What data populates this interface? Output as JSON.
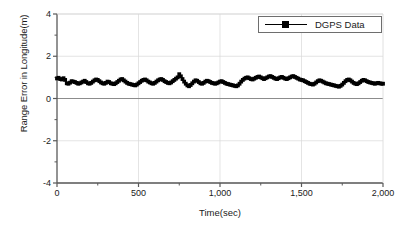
{
  "chart_data": {
    "type": "scatter",
    "title": "",
    "xlabel": "Time(sec)",
    "ylabel": "Range Error in Longitude(m)",
    "xlim": [
      0,
      2000
    ],
    "ylim": [
      -4,
      4
    ],
    "xticks": [
      0,
      500,
      1000,
      1500,
      2000
    ],
    "xtick_labels": [
      "0",
      "500",
      "1,000",
      "1,500",
      "2,000"
    ],
    "yticks": [
      4,
      2,
      0,
      -2,
      -4
    ],
    "ytick_labels": [
      "4",
      "2",
      "0",
      "-2",
      "-4"
    ],
    "grid": true,
    "grid_color": "#d8d8d8",
    "zero_line": true,
    "zero_line_color": "#8c8c8c",
    "legend": {
      "position": "top-right",
      "boxed": true,
      "entries": [
        {
          "name": "DGPS Data",
          "marker": "square",
          "marker_color": "#000000",
          "line_color": "#000000"
        }
      ]
    },
    "series": [
      {
        "name": "DGPS Data",
        "marker": "square",
        "color": "#000000",
        "x": [
          0,
          10,
          20,
          30,
          40,
          50,
          60,
          70,
          80,
          90,
          100,
          110,
          120,
          130,
          140,
          150,
          160,
          170,
          180,
          190,
          200,
          210,
          220,
          230,
          240,
          250,
          260,
          270,
          280,
          290,
          300,
          310,
          320,
          330,
          340,
          350,
          360,
          370,
          380,
          390,
          400,
          410,
          420,
          430,
          440,
          450,
          460,
          470,
          480,
          490,
          500,
          510,
          520,
          530,
          540,
          550,
          560,
          570,
          580,
          590,
          600,
          610,
          620,
          630,
          640,
          650,
          660,
          670,
          680,
          690,
          700,
          710,
          720,
          730,
          740,
          750,
          760,
          770,
          780,
          790,
          800,
          810,
          820,
          830,
          840,
          850,
          860,
          870,
          880,
          890,
          900,
          910,
          920,
          930,
          940,
          950,
          960,
          970,
          980,
          990,
          1000,
          1010,
          1020,
          1030,
          1040,
          1050,
          1060,
          1070,
          1080,
          1090,
          1100,
          1110,
          1120,
          1130,
          1140,
          1150,
          1160,
          1170,
          1180,
          1190,
          1200,
          1210,
          1220,
          1230,
          1240,
          1250,
          1260,
          1270,
          1280,
          1290,
          1300,
          1310,
          1320,
          1330,
          1340,
          1350,
          1360,
          1370,
          1380,
          1390,
          1400,
          1410,
          1420,
          1430,
          1440,
          1450,
          1460,
          1470,
          1480,
          1490,
          1500,
          1510,
          1520,
          1530,
          1540,
          1550,
          1560,
          1570,
          1580,
          1590,
          1600,
          1610,
          1620,
          1630,
          1640,
          1650,
          1660,
          1670,
          1680,
          1690,
          1700,
          1710,
          1720,
          1730,
          1740,
          1750,
          1760,
          1770,
          1780,
          1790,
          1800,
          1810,
          1820,
          1830,
          1840,
          1850,
          1860,
          1870,
          1880,
          1890,
          1900,
          1910,
          1920,
          1930,
          1940,
          1950,
          1960,
          1970,
          1980,
          1990,
          2000
        ],
        "y": [
          0.95,
          0.98,
          0.92,
          0.9,
          0.96,
          0.88,
          0.72,
          0.7,
          0.75,
          0.82,
          0.8,
          0.78,
          0.74,
          0.7,
          0.72,
          0.76,
          0.8,
          0.84,
          0.78,
          0.72,
          0.7,
          0.74,
          0.8,
          0.86,
          0.9,
          0.88,
          0.82,
          0.76,
          0.72,
          0.7,
          0.74,
          0.8,
          0.78,
          0.72,
          0.7,
          0.68,
          0.72,
          0.78,
          0.84,
          0.9,
          0.92,
          0.86,
          0.8,
          0.74,
          0.7,
          0.68,
          0.66,
          0.64,
          0.62,
          0.66,
          0.72,
          0.78,
          0.84,
          0.88,
          0.9,
          0.86,
          0.8,
          0.76,
          0.72,
          0.7,
          0.74,
          0.8,
          0.86,
          0.9,
          0.92,
          0.88,
          0.82,
          0.78,
          0.74,
          0.72,
          0.76,
          0.82,
          0.88,
          0.94,
          1.0,
          1.15,
          1.05,
          0.92,
          0.8,
          0.7,
          0.62,
          0.58,
          0.64,
          0.72,
          0.8,
          0.86,
          0.84,
          0.78,
          0.72,
          0.7,
          0.74,
          0.8,
          0.84,
          0.82,
          0.78,
          0.74,
          0.72,
          0.7,
          0.72,
          0.76,
          0.8,
          0.82,
          0.78,
          0.74,
          0.7,
          0.68,
          0.66,
          0.64,
          0.62,
          0.6,
          0.58,
          0.62,
          0.7,
          0.8,
          0.88,
          0.94,
          0.98,
          1.0,
          0.96,
          0.92,
          0.9,
          0.94,
          0.98,
          1.02,
          1.04,
          1.0,
          0.96,
          0.92,
          0.96,
          1.0,
          1.04,
          1.06,
          1.02,
          0.98,
          0.94,
          0.92,
          0.96,
          1.0,
          1.02,
          0.98,
          0.94,
          0.92,
          0.96,
          1.0,
          1.04,
          1.06,
          1.02,
          0.98,
          0.94,
          0.9,
          0.88,
          0.86,
          0.82,
          0.78,
          0.74,
          0.7,
          0.68,
          0.66,
          0.7,
          0.76,
          0.82,
          0.86,
          0.84,
          0.8,
          0.76,
          0.72,
          0.7,
          0.68,
          0.66,
          0.64,
          0.62,
          0.6,
          0.58,
          0.56,
          0.6,
          0.66,
          0.74,
          0.82,
          0.88,
          0.9,
          0.86,
          0.8,
          0.74,
          0.7,
          0.68,
          0.72,
          0.78,
          0.84,
          0.88,
          0.86,
          0.82,
          0.78,
          0.76,
          0.74,
          0.72,
          0.7,
          0.72,
          0.74,
          0.72,
          0.7,
          0.7
        ]
      }
    ]
  },
  "axes": {
    "frame_color": "#595959",
    "tick_color": "#595959"
  }
}
